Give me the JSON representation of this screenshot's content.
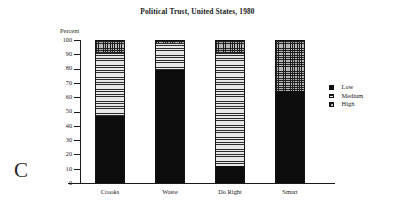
{
  "panel": {
    "letter": "C"
  },
  "chart_data": {
    "type": "bar",
    "subtype": "stacked-bar-100",
    "title": "Political Trust, United States, 1980",
    "xlabel": "",
    "ylabel": "Percent",
    "ylim": [
      0,
      100
    ],
    "ytick_step": 10,
    "yticks": [
      "100",
      "90",
      "80",
      "70",
      "60",
      "50",
      "40",
      "30",
      "20",
      "10",
      "0"
    ],
    "grid": false,
    "legend_position": "right",
    "categories": [
      "Crooks",
      "Waste",
      "Do Right",
      "Smart"
    ],
    "series": [
      {
        "name": "Low",
        "pattern": "solid-black",
        "values": [
          47,
          79,
          12,
          64
        ]
      },
      {
        "name": "Medium",
        "pattern": "horizontal-lines",
        "values": [
          44,
          19,
          79,
          0
        ]
      },
      {
        "name": "High",
        "pattern": "cross-hatch",
        "values": [
          9,
          2,
          9,
          36
        ]
      }
    ],
    "cumulative_tops": {
      "Crooks": {
        "low": 47,
        "medium": 91,
        "high": 100
      },
      "Waste": {
        "low": 79,
        "medium": 98,
        "high": 100
      },
      "Do Right": {
        "low": 12,
        "medium": 91,
        "high": 100
      },
      "Smart": {
        "low": 64,
        "medium": 64,
        "high": 100
      }
    }
  },
  "legend": {
    "items": [
      {
        "label": "Low",
        "swatch": "swatch-low-icon"
      },
      {
        "label": "Medium",
        "swatch": "swatch-medium-icon"
      },
      {
        "label": "High",
        "swatch": "swatch-high-icon"
      }
    ]
  }
}
